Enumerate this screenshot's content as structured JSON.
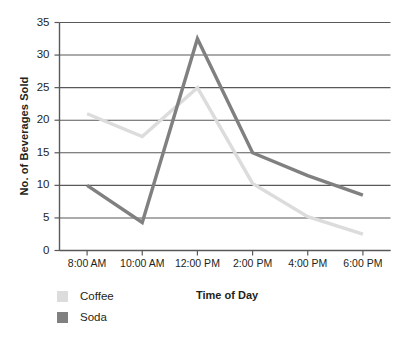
{
  "chart_data": {
    "type": "line",
    "title": "",
    "subtitle": "",
    "xlabel": "Time of Day",
    "ylabel": "No. of Beverages Sold",
    "categories": [
      "8:00 AM",
      "10:00 AM",
      "12:00 PM",
      "2:00 PM",
      "4:00 PM",
      "6:00 PM"
    ],
    "series": [
      {
        "name": "Coffee",
        "color": "#dcdcdc",
        "values": [
          21,
          17.5,
          25,
          10.3,
          5.2,
          2.5
        ]
      },
      {
        "name": "Soda",
        "color": "#808080",
        "values": [
          10,
          4.3,
          32.5,
          15,
          11.5,
          8.5
        ]
      }
    ],
    "ylim": [
      0,
      35
    ],
    "y_ticks": [
      0,
      5,
      10,
      15,
      20,
      25,
      30,
      35
    ],
    "y_tick_labels": [
      "0",
      "5",
      "10",
      "15",
      "20",
      "25",
      "30",
      "35"
    ],
    "grid": "horizontal",
    "legend_position": "bottom-left",
    "axis_color": "#595959",
    "grid_color": "#595959"
  },
  "legend": {
    "items": [
      {
        "label": "Coffee",
        "color": "#dcdcdc"
      },
      {
        "label": "Soda",
        "color": "#808080"
      }
    ]
  },
  "axes": {
    "x_title": "Time of Day",
    "y_title": "No. of Beverages Sold"
  }
}
